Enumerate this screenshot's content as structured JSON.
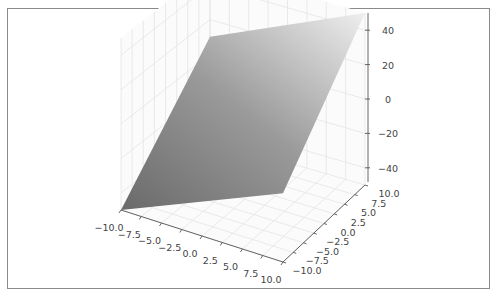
{
  "chart_data": {
    "type": "surface3d",
    "title": "",
    "xlabel": "",
    "ylabel": "",
    "zlabel": "",
    "surface": {
      "description": "planar surface",
      "corners": [
        {
          "x": -10,
          "y": -10,
          "z": -50
        },
        {
          "x": 10,
          "y": -10,
          "z": -10
        },
        {
          "x": 10,
          "y": 10,
          "z": 50
        },
        {
          "x": -10,
          "y": 10,
          "z": 10
        }
      ],
      "colormap": "gray",
      "color_low": "#6a6a6a",
      "color_high": "#eeeeee"
    },
    "x_ticks": [
      "−10.0",
      "−7.5",
      "−5.0",
      "−2.5",
      "0.0",
      "2.5",
      "5.0",
      "7.5",
      "10.0"
    ],
    "y_ticks": [
      "−10.0",
      "−7.5",
      "−5.0",
      "−2.5",
      "0.0",
      "2.5",
      "5.0",
      "7.5",
      "10.0"
    ],
    "z_ticks": [
      "−40",
      "−20",
      "0",
      "20",
      "40"
    ],
    "xlim": [
      -10,
      10
    ],
    "ylim": [
      -10,
      10
    ],
    "zlim": [
      -50,
      50
    ],
    "grid": true
  }
}
